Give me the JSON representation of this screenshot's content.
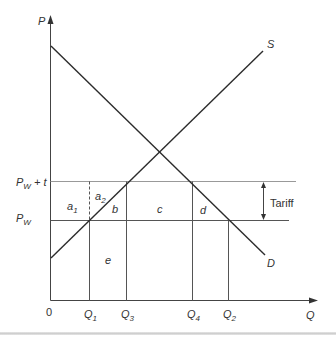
{
  "diagram": {
    "type": "tariff-welfare-supply-demand",
    "axes": {
      "y_label": "P",
      "x_label": "Q",
      "origin_label": "0"
    },
    "curves": {
      "supply_label": "S",
      "demand_label": "D"
    },
    "price_levels": [
      {
        "id": "pw_t",
        "base": "P",
        "sub": "W",
        "suffix": " + t"
      },
      {
        "id": "pw",
        "base": "P",
        "sub": "W",
        "suffix": ""
      }
    ],
    "quantities": [
      {
        "id": "q1",
        "base": "Q",
        "sub": "1"
      },
      {
        "id": "q3",
        "base": "Q",
        "sub": "3"
      },
      {
        "id": "q4",
        "base": "Q",
        "sub": "4"
      },
      {
        "id": "q2",
        "base": "Q",
        "sub": "2"
      }
    ],
    "areas": [
      {
        "id": "a1",
        "base": "a",
        "sub": "1"
      },
      {
        "id": "a2",
        "base": "a",
        "sub": "2"
      },
      {
        "id": "b",
        "base": "b",
        "sub": ""
      },
      {
        "id": "c",
        "base": "c",
        "sub": ""
      },
      {
        "id": "d",
        "base": "d",
        "sub": ""
      },
      {
        "id": "e",
        "base": "e",
        "sub": ""
      }
    ],
    "tariff_label": "Tariff",
    "colors": {
      "line": "#2b2b2b",
      "guide": "#555555",
      "text": "#333333"
    }
  }
}
